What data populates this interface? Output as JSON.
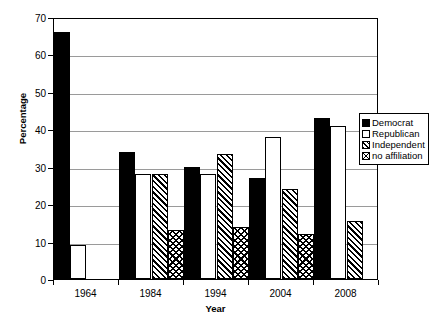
{
  "chart_data": {
    "type": "bar",
    "title": "",
    "xlabel": "Year",
    "ylabel": "Percentage",
    "categories": [
      "1964",
      "1984",
      "1994",
      "2004",
      "2008"
    ],
    "ylim": [
      0,
      70
    ],
    "yticks": [
      0,
      10,
      20,
      30,
      40,
      50,
      60,
      70
    ],
    "grid": true,
    "legend_position": "right",
    "series": [
      {
        "name": "Democrat",
        "pattern": "solid-black",
        "values": [
          66,
          34,
          30,
          27,
          43
        ]
      },
      {
        "name": "Republican",
        "pattern": "white-outline",
        "values": [
          9,
          28,
          28,
          38,
          41
        ]
      },
      {
        "name": "Independent",
        "pattern": "diagonal-hatch",
        "values": [
          null,
          28,
          33.5,
          24,
          15.5
        ]
      },
      {
        "name": "no affiliation",
        "pattern": "herringbone-hatch",
        "values": [
          null,
          13,
          14,
          12,
          null
        ]
      }
    ]
  },
  "legend": {
    "items": [
      {
        "label": "Democrat"
      },
      {
        "label": "Republican"
      },
      {
        "label": "Independent"
      },
      {
        "label": "no affiliation"
      }
    ]
  },
  "axes": {
    "y_title": "Percentage",
    "x_title": "Year",
    "y_tick_labels": [
      "70",
      "60",
      "50",
      "40",
      "30",
      "20",
      "10",
      "0"
    ],
    "x_tick_labels": [
      "1964",
      "1984",
      "1994",
      "2004",
      "2008"
    ]
  },
  "colors": {
    "ink": "#000000",
    "gridline": "#9a9a9a",
    "background": "#ffffff"
  }
}
